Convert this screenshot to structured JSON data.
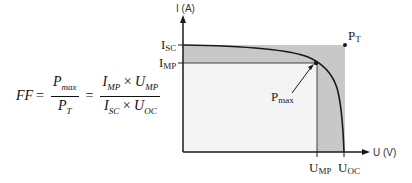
{
  "formula": {
    "lhs": "FF",
    "equals": "=",
    "frac1": {
      "num_main": "P",
      "num_sub": "max",
      "den_main": "P",
      "den_sub": "T"
    },
    "frac2": {
      "num_a_main": "I",
      "num_a_sub": "MP",
      "num_op": "×",
      "num_b_main": "U",
      "num_b_sub": "MP",
      "den_a_main": "I",
      "den_a_sub": "SC",
      "den_op": "×",
      "den_b_main": "U",
      "den_b_sub": "OC"
    }
  },
  "chart": {
    "y_axis_label": "I (A)",
    "x_axis_label": "U (V)",
    "isc_label_main": "I",
    "isc_label_sub": "SC",
    "imp_label_main": "I",
    "imp_label_sub": "MP",
    "ump_label_main": "U",
    "ump_label_sub": "MP",
    "uoc_label_main": "U",
    "uoc_label_sub": "OC",
    "pt_label_main": "P",
    "pt_label_sub": "T",
    "pmax_label_main": "P",
    "pmax_label_sub": "max",
    "colors": {
      "shade": "#c8c8c8",
      "inner": "#f4f4f4",
      "line": "#1a1a1a"
    }
  }
}
